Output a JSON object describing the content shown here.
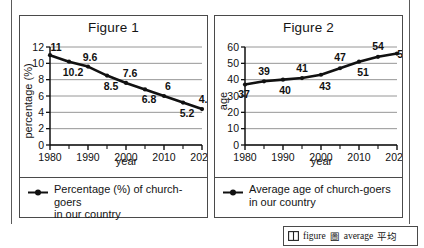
{
  "page": {
    "vocab": {
      "icon": "book-icon",
      "entries": [
        {
          "term": "figure",
          "gloss": "圖"
        },
        {
          "term": "average",
          "gloss": "平均"
        }
      ]
    }
  },
  "figures": [
    {
      "title": "Figure 1",
      "legend": {
        "marker": "line-dot-marker",
        "line1": "Percentage (%) of church-goers",
        "line2": "in our country"
      },
      "chart_data": {
        "type": "line",
        "title": "Figure 1",
        "xlabel": "year",
        "ylabel": "percentage (%)",
        "x": [
          1980,
          1985,
          1990,
          1995,
          2000,
          2005,
          2010,
          2015,
          2020
        ],
        "values": [
          11,
          10.2,
          9.6,
          8.5,
          7.6,
          6.8,
          6,
          5.2,
          4.4
        ],
        "point_labels": [
          "11",
          "10.2",
          "9.6",
          "8.5",
          "7.6",
          "6.8",
          "6",
          "5.2",
          "4.4"
        ],
        "xlim": [
          1980,
          2020
        ],
        "ylim": [
          0,
          12
        ],
        "yticks": [
          0,
          2,
          4,
          6,
          8,
          10,
          12
        ],
        "ytick_labels": [
          "0",
          "2",
          "4",
          "6",
          "8",
          "10",
          "12"
        ],
        "xticks": [
          1980,
          1990,
          2000,
          2010,
          2020
        ],
        "xtick_labels": [
          "1980",
          "1990",
          "2000",
          "2010",
          "2020"
        ],
        "minor_xticks": [
          1985,
          1995,
          2005,
          2015
        ],
        "grid": "horizontal",
        "legend_position": "below-plot"
      }
    },
    {
      "title": "Figure 2",
      "legend": {
        "marker": "line-dot-marker",
        "line1": "Average age of church-goers",
        "line2": "in our country"
      },
      "chart_data": {
        "type": "line",
        "title": "Figure 2",
        "xlabel": "year",
        "ylabel": "age",
        "x": [
          1980,
          1985,
          1990,
          1995,
          2000,
          2005,
          2010,
          2015,
          2020
        ],
        "values": [
          37,
          39,
          40,
          41,
          43,
          47,
          51,
          54,
          56
        ],
        "point_labels": [
          "37",
          "39",
          "40",
          "41",
          "43",
          "47",
          "51",
          "54",
          "56"
        ],
        "xlim": [
          1980,
          2020
        ],
        "ylim": [
          0,
          60
        ],
        "yticks": [
          0,
          10,
          20,
          30,
          40,
          50,
          60
        ],
        "ytick_labels": [
          "0",
          "10",
          "20",
          "30",
          "40",
          "50",
          "60"
        ],
        "xticks": [
          1980,
          1990,
          2000,
          2010,
          2020
        ],
        "xtick_labels": [
          "1980",
          "1990",
          "2000",
          "2010",
          "2020"
        ],
        "minor_xticks": [
          1985,
          1995,
          2005,
          2015
        ],
        "grid": "horizontal",
        "legend_position": "below-plot"
      }
    }
  ]
}
